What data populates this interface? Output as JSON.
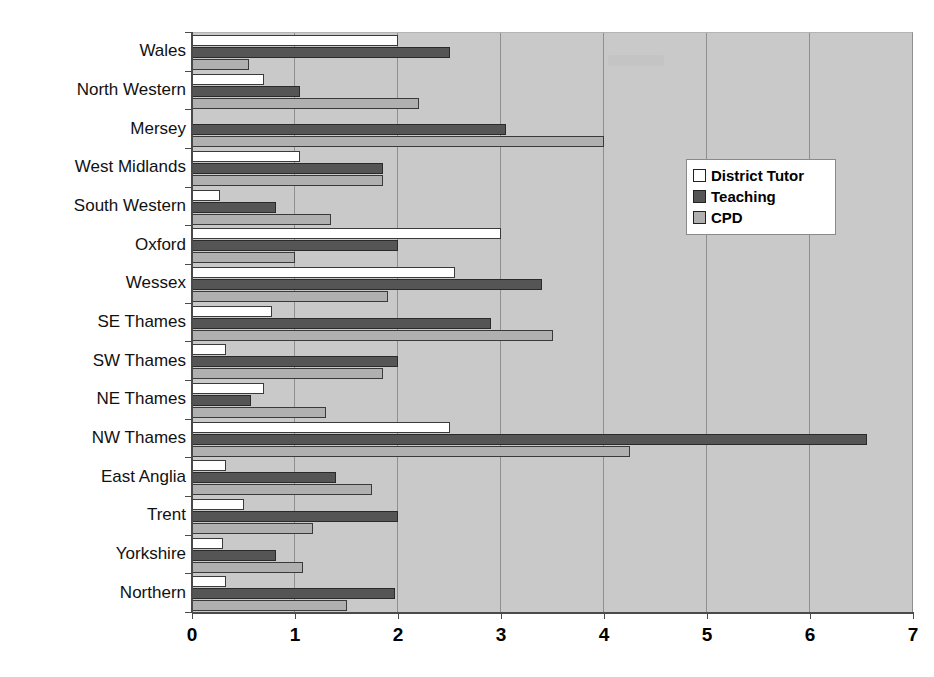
{
  "chart_data": {
    "type": "bar",
    "orientation": "horizontal",
    "title": "",
    "xlabel": "",
    "ylabel": "",
    "xlim": [
      0,
      7
    ],
    "xticks": [
      "0",
      "1",
      "2",
      "3",
      "4",
      "5",
      "6",
      "7"
    ],
    "grid": true,
    "legend_position": "center-right",
    "categories": [
      "Wales",
      "North Western",
      "Mersey",
      "West Midlands",
      "South Western",
      "Oxford",
      "Wessex",
      "SE Thames",
      "SW Thames",
      "NE Thames",
      "NW Thames",
      "East Anglia",
      "Trent",
      "Yorkshire",
      "Northern"
    ],
    "series": [
      {
        "name": "District Tutor",
        "color": "#ffffff",
        "values": [
          2.0,
          0.7,
          0.0,
          1.05,
          0.27,
          3.0,
          2.55,
          0.78,
          0.33,
          0.7,
          2.5,
          0.33,
          0.5,
          0.3,
          0.33
        ]
      },
      {
        "name": "Teaching",
        "color": "#555555",
        "values": [
          2.5,
          1.05,
          3.05,
          1.85,
          0.82,
          2.0,
          3.4,
          2.9,
          2.0,
          0.57,
          6.55,
          1.4,
          2.0,
          0.82,
          1.97
        ]
      },
      {
        "name": "CPD",
        "color": "#b0b0b0",
        "values": [
          0.55,
          2.2,
          4.0,
          1.85,
          1.35,
          1.0,
          1.9,
          3.5,
          1.85,
          1.3,
          4.25,
          1.75,
          1.17,
          1.08,
          1.5
        ]
      }
    ]
  },
  "legend": {
    "items": [
      {
        "label": "District Tutor",
        "key": "dt"
      },
      {
        "label": "Teaching",
        "key": "tch"
      },
      {
        "label": "CPD",
        "key": "cpd"
      }
    ]
  }
}
